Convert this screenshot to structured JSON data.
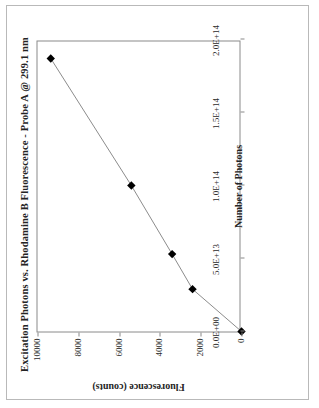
{
  "document": {
    "kind": "scanned-figure",
    "orientation": "rotated-90-ccw",
    "page_border_color": "#b9b9b9",
    "background": "#ffffff"
  },
  "chart_data": {
    "type": "scatter",
    "title": "Excitation Photons vs. Rhodamine B Fluorescence - Probe A @ 299.1 nm",
    "xlabel": "Number of Photons",
    "ylabel": "Fluorescence (counts)",
    "xlim": [
      0,
      200000000000000.0
    ],
    "ylim": [
      0,
      10000
    ],
    "grid": false,
    "legend": null,
    "marker": "filled-diamond",
    "marker_color": "#000000",
    "line_color": "#808080",
    "xticks": [
      0,
      50000000000000.0,
      100000000000000.0,
      150000000000000.0,
      200000000000000.0
    ],
    "xticklabels": [
      "0.0E+00",
      "5.0E+13",
      "1.0E+14",
      "1.5E+14",
      "2.0E+14"
    ],
    "yticks": [
      0,
      2000,
      4000,
      6000,
      8000,
      10000
    ],
    "yticklabels": [
      "0",
      "2000",
      "4000",
      "6000",
      "8000",
      "10000"
    ],
    "x": [
      0,
      29000000000000.0,
      53000000000000.0,
      100000000000000.0,
      187000000000000.0
    ],
    "y": [
      0,
      2400,
      3400,
      5400,
      9350
    ],
    "points": [
      {
        "x": 0,
        "y": 0
      },
      {
        "x": 29000000000000.0,
        "y": 2400
      },
      {
        "x": 53000000000000.0,
        "y": 3400
      },
      {
        "x": 100000000000000.0,
        "y": 5400
      },
      {
        "x": 187000000000000.0,
        "y": 9350
      }
    ]
  }
}
